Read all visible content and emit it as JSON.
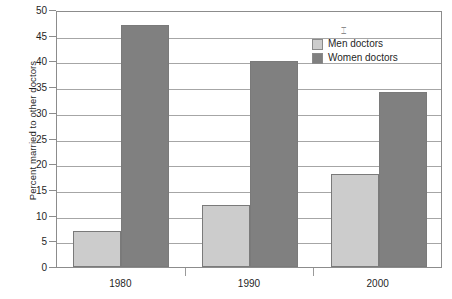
{
  "chart_data": {
    "type": "bar",
    "title": "",
    "xlabel": "",
    "ylabel": "Percent married to other doctors",
    "categories": [
      "1980",
      "1990",
      "2000"
    ],
    "series": [
      {
        "name": "Men doctors",
        "color": "#cccccc",
        "values": [
          7,
          12,
          18
        ]
      },
      {
        "name": "Women doctors",
        "color": "#808080",
        "values": [
          47,
          40,
          34
        ]
      }
    ],
    "ylim": [
      0,
      50
    ],
    "ytick_step": 5,
    "yticks": [
      "0",
      "5",
      "10",
      "15",
      "20",
      "25",
      "30",
      "35",
      "40",
      "45",
      "50"
    ],
    "grid": true,
    "legend_position": "top-right"
  },
  "axes": {
    "y_title": "Percent married to other doctors"
  },
  "legend": {
    "items": [
      {
        "label": "Men doctors"
      },
      {
        "label": "Women doctors"
      }
    ],
    "artifact_glyph": "⌶"
  },
  "colors": {
    "men": "#cccccc",
    "women": "#808080",
    "grid": "#a6a6a6",
    "frame": "#8c8c8c",
    "text": "#1f1f1f",
    "background": "#ffffff"
  }
}
